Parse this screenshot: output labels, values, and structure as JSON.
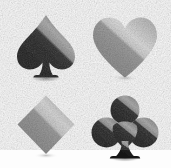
{
  "image": {
    "title": "Playing card suit symbols",
    "width": 171,
    "height": 168,
    "background_color": "#fdfdfd",
    "texture": "film-grain",
    "layout": "2x2-grid"
  },
  "palette": {
    "background": "#fdfdfd",
    "dark_body": "#1e1e1e",
    "dark_highlight": "#5e5e5e",
    "dark_highlight_bright": "#9a9a9a",
    "mid_body": "#8b8b8b",
    "mid_highlight": "#bdbdbd",
    "mid_highlight_bright": "#d8d8d8",
    "shadow": "#9d9d9d"
  },
  "suits": [
    {
      "id": "spade",
      "label": "Spade",
      "symbol": "♠",
      "position": "top-left",
      "tone": "dark",
      "body_color": "#1e1e1e",
      "highlight_color": "#6a6a6a",
      "highlight_direction": "upper-right diagonal",
      "has_stem": true,
      "has_shadow": true
    },
    {
      "id": "heart",
      "label": "Heart",
      "symbol": "♥",
      "position": "top-right",
      "tone": "mid",
      "body_color": "#8b8b8b",
      "highlight_color": "#c6c6c6",
      "highlight_direction": "upper-right diagonal",
      "has_stem": false,
      "has_shadow": true
    },
    {
      "id": "diamond",
      "label": "Diamond",
      "symbol": "♦",
      "position": "bottom-left",
      "tone": "mid",
      "body_color": "#8b8b8b",
      "highlight_color": "#c2c2c2",
      "highlight_direction": "upper-right diagonal",
      "has_stem": false,
      "has_shadow": true
    },
    {
      "id": "club",
      "label": "Club",
      "symbol": "♣",
      "position": "bottom-right",
      "tone": "dark",
      "body_color": "#1e1e1e",
      "highlight_color": "#8e8e8e",
      "highlight_direction": "upper-left lobe diagonal",
      "has_stem": true,
      "has_shadow": true
    }
  ]
}
